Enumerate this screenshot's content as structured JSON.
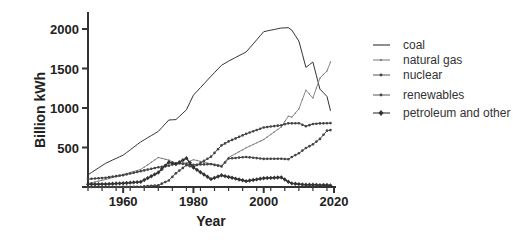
{
  "chart_data": {
    "type": "line",
    "title": "",
    "xlabel": "Year",
    "ylabel": "Billion kWh",
    "xlim": [
      1950,
      2020
    ],
    "ylim": [
      0,
      2200
    ],
    "xticks": [
      1960,
      1980,
      2000,
      2020
    ],
    "yticks": [
      500,
      1000,
      1500,
      2000
    ],
    "grid": false,
    "legend_position": "right",
    "x": [
      1950,
      1955,
      1960,
      1965,
      1970,
      1973,
      1975,
      1978,
      1980,
      1985,
      1988,
      1990,
      1995,
      2000,
      2005,
      2007,
      2008,
      2010,
      2012,
      2014,
      2016,
      2018,
      2019
    ],
    "series": [
      {
        "name": "coal",
        "marker": "none",
        "color": "#333333",
        "values": [
          155,
          300,
          403,
          571,
          704,
          848,
          853,
          976,
          1162,
          1402,
          1541,
          1594,
          1709,
          1966,
          2013,
          2016,
          1986,
          1847,
          1514,
          1582,
          1239,
          1146,
          965
        ]
      },
      {
        "name": "natural gas",
        "marker": "small-tick",
        "color": "#888888",
        "values": [
          45,
          95,
          158,
          222,
          373,
          341,
          300,
          305,
          346,
          292,
          273,
          373,
          496,
          601,
          761,
          897,
          883,
          988,
          1226,
          1127,
          1378,
          1469,
          1582
        ]
      },
      {
        "name": "nuclear",
        "marker": "small-dot",
        "color": "#444444",
        "values": [
          0,
          0,
          1,
          4,
          22,
          83,
          173,
          276,
          251,
          384,
          527,
          577,
          673,
          754,
          782,
          806,
          806,
          807,
          769,
          797,
          805,
          807,
          809
        ]
      },
      {
        "name": "renewables",
        "marker": "small-dot",
        "color": "#444444",
        "values": [
          100,
          118,
          150,
          200,
          250,
          270,
          300,
          290,
          280,
          290,
          260,
          360,
          380,
          356,
          358,
          352,
          380,
          427,
          494,
          540,
          609,
          713,
          720
        ]
      },
      {
        "name": "petroleum and other",
        "marker": "diamond",
        "color": "#333333",
        "values": [
          34,
          37,
          48,
          65,
          184,
          314,
          289,
          365,
          246,
          100,
          148,
          127,
          74,
          111,
          122,
          66,
          46,
          37,
          28,
          30,
          24,
          25,
          19
        ]
      }
    ]
  },
  "axes": {
    "xlabel": "Year",
    "ylabel": "Billion kWh",
    "xtick_labels": [
      "1960",
      "1980",
      "2000",
      "2020"
    ],
    "ytick_labels": [
      "500",
      "1000",
      "1500",
      "2000"
    ]
  },
  "legend": {
    "items": [
      {
        "label": "coal"
      },
      {
        "label": "natural gas"
      },
      {
        "label": "nuclear"
      },
      {
        "label": "renewables"
      },
      {
        "label": "petroleum and other"
      }
    ]
  }
}
